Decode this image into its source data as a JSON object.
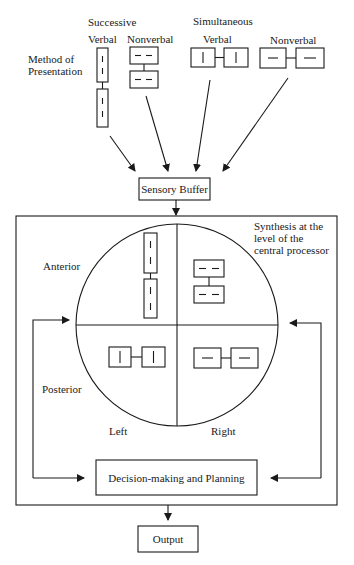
{
  "diagram": {
    "header": {
      "successive": "Successive",
      "simultaneous": "Simultaneous",
      "verbal_1": "Verbal",
      "nonverbal_1": "Nonverbal",
      "verbal_2": "Verbal",
      "nonverbal_2": "Nonverbal",
      "method_line1": "Method of",
      "method_line2": "Presentation"
    },
    "nodes": {
      "sensory_buffer": "Sensory Buffer",
      "decision": "Decision-making and Planning",
      "output": "Output"
    },
    "processor": {
      "synthesis_line1": "Synthesis at the",
      "synthesis_line2": "level of the",
      "synthesis_line3": "central processor",
      "anterior": "Anterior",
      "posterior": "Posterior",
      "left": "Left",
      "right": "Right"
    },
    "colors": {
      "stroke": "#1a1a1a",
      "background": "#ffffff"
    }
  }
}
